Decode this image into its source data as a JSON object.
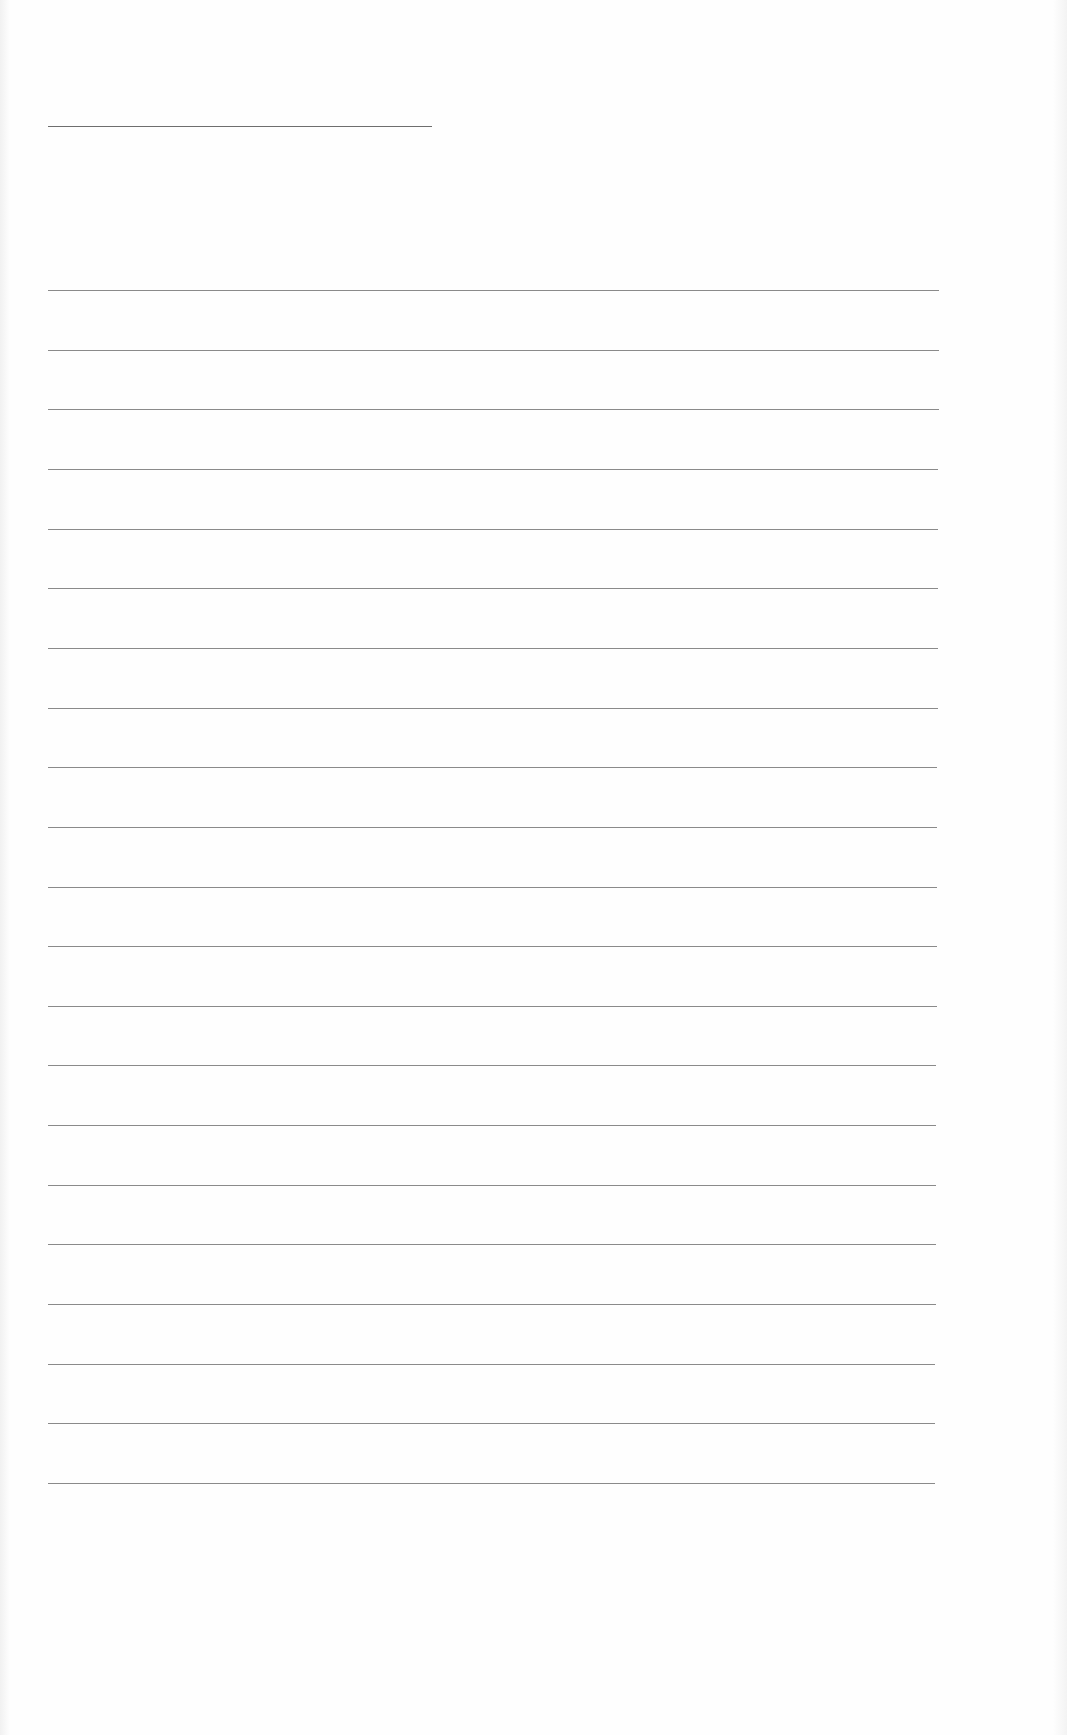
{
  "document": {
    "type": "blank-ruled-sheet",
    "text_content": "",
    "header_line": {
      "x1": 48,
      "x2": 432,
      "y": 126,
      "color": "#6e6e6e"
    },
    "ruled_lines": {
      "count": 21,
      "x_start": 48,
      "x_end_first": 939,
      "x_end_last": 935,
      "y_first": 290,
      "y_last": 1483,
      "color": "#8a8a8a"
    }
  }
}
